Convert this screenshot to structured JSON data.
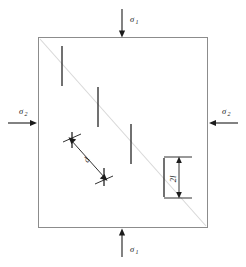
{
  "figure": {
    "background_color": "#ffffff",
    "line_color": "#1c1c1c",
    "edge_color": "#8c8c8c",
    "shear_band_color": "#d8d8d8"
  },
  "specimen": {
    "name": "square-specimen",
    "left": 38,
    "top": 37,
    "right": 208,
    "bottom": 228
  },
  "shear_band": {
    "name": "shear-band",
    "x1": 40,
    "y1": 39,
    "x2": 206,
    "y2": 226
  },
  "loads": [
    {
      "id": "load-top",
      "label": "σ",
      "subscript": "1",
      "direction": "down",
      "label_x": 130,
      "label_y": 22,
      "sub_x": 135.4,
      "sub_y": 24.4,
      "line_x1": 122,
      "line_y1": 9,
      "line_x2": 122,
      "line_y2": 34,
      "head_points": "122,37.5 118.9,30.5 125.1,30.5"
    },
    {
      "id": "load-left",
      "label": "σ",
      "subscript": "2",
      "direction": "right",
      "label_x": 19,
      "label_y": 114,
      "sub_x": 24.4,
      "sub_y": 116.4,
      "line_x1": 8,
      "line_y1": 123,
      "line_x2": 33,
      "line_y2": 123,
      "head_points": "37,123 30,119.9 30,126.1"
    },
    {
      "id": "load-right",
      "label": "σ",
      "subscript": "2",
      "direction": "left",
      "label_x": 222,
      "label_y": 114,
      "sub_x": 227.4,
      "sub_y": 116.4,
      "line_x1": 238,
      "line_y1": 123,
      "line_x2": 213,
      "line_y2": 123,
      "head_points": "209,123 216,119.9 216,126.1"
    },
    {
      "id": "load-bottom",
      "label": "σ",
      "subscript": "1",
      "direction": "up",
      "label_x": 130,
      "label_y": 252,
      "sub_x": 135.4,
      "sub_y": 254.4,
      "line_x1": 122,
      "line_y1": 257,
      "line_x2": 122,
      "line_y2": 232,
      "head_points": "122,228.5 118.9,235.5 125.1,235.5"
    }
  ],
  "cracks": [
    {
      "id": "crack-1",
      "x": 62,
      "y1": 46,
      "y2": 86
    },
    {
      "id": "crack-2",
      "x": 98,
      "y1": 87,
      "y2": 127
    },
    {
      "id": "crack-3",
      "x": 131,
      "y1": 124,
      "y2": 164
    },
    {
      "id": "crack-4",
      "x": 164,
      "y1": 158,
      "y2": 197
    },
    {
      "id": "crack-d-upper",
      "x": 72,
      "y1": 132,
      "y2": 148
    },
    {
      "id": "crack-d-lower",
      "x": 104,
      "y1": 168,
      "y2": 186
    }
  ],
  "crack_overlays": [
    {
      "id": "crack-tick-upper",
      "x1": 63,
      "y1": 142,
      "x2": 81,
      "y2": 134
    },
    {
      "id": "crack-tick-lower",
      "x1": 95,
      "y1": 184,
      "x2": 113,
      "y2": 176
    }
  ],
  "dimensions": [
    {
      "id": "dim-spacing-d",
      "label": "d",
      "label_x": 89,
      "label_y": 161,
      "label_rotation": -62,
      "line_x1": 71,
      "line_y1": 140,
      "line_x2": 105,
      "line_y2": 178,
      "head_start": "68.5,137.2 76.2,139.4 71.4,144.0",
      "head_end": "107.5,180.8 99.8,178.6 104.6,174.0"
    },
    {
      "id": "dim-length-2l",
      "label": "2l",
      "label_x": 176,
      "label_y": 179,
      "label_rotation": -90,
      "line_x1": 179,
      "line_y1": 159,
      "line_x2": 179,
      "line_y2": 196,
      "head_start": "179,156.5 176.2,163.0 181.8,163.0",
      "head_end": "179,198.5 176.2,192.0 181.8,192.0",
      "tick_top_x1": 164,
      "tick_top_x2": 192,
      "tick_top_y": 157,
      "tick_bottom_x1": 164,
      "tick_bottom_x2": 192,
      "tick_bottom_y": 198
    }
  ]
}
